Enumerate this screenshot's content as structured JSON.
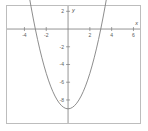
{
  "figure": {
    "name": "parabola-graph",
    "background_color": "#ffffff",
    "frame_color": "#bdbdbd",
    "axis_color": "#7a7a7a",
    "curve_color": "#808080",
    "label_color": "#5a5a5a"
  },
  "chart_data": {
    "type": "line",
    "title": "",
    "xlabel": "x",
    "ylabel": "y",
    "xlim": [
      -5.6,
      6.6
    ],
    "ylim": [
      -10.6,
      2.6
    ],
    "grid": false,
    "legend": null,
    "x_ticks": [
      -4,
      -2,
      2,
      4,
      6
    ],
    "x_tick_labels": [
      "-4",
      "-2",
      "2",
      "4",
      "6"
    ],
    "y_ticks": [
      2,
      -2,
      -4,
      -6,
      -8
    ],
    "y_tick_labels": [
      "2",
      "-2",
      "-4",
      "-6",
      "-8"
    ],
    "equation": "y = x^2 - 9",
    "vertex": [
      0,
      -9
    ],
    "x_intercepts": [
      -3,
      3
    ],
    "y_intercept": -9,
    "series": [
      {
        "name": "y = x^2 - 9",
        "x": [
          -3.6,
          -3.4,
          -3.2,
          -3.0,
          -2.8,
          -2.6,
          -2.4,
          -2.2,
          -2.0,
          -1.8,
          -1.6,
          -1.4,
          -1.2,
          -1.0,
          -0.8,
          -0.6,
          -0.4,
          -0.2,
          0.0,
          0.2,
          0.4,
          0.6,
          0.8,
          1.0,
          1.2,
          1.4,
          1.6,
          1.8,
          2.0,
          2.2,
          2.4,
          2.6,
          2.8,
          3.0,
          3.2,
          3.4,
          3.6
        ],
        "y": [
          3.96,
          2.56,
          1.24,
          0.0,
          -1.16,
          -2.24,
          -3.24,
          -4.16,
          -5.0,
          -5.76,
          -6.44,
          -7.04,
          -7.56,
          -8.0,
          -8.36,
          -8.64,
          -8.84,
          -8.96,
          -9.0,
          -8.96,
          -8.84,
          -8.64,
          -8.36,
          -8.0,
          -7.56,
          -7.04,
          -6.44,
          -5.76,
          -5.0,
          -4.16,
          -3.24,
          -2.24,
          -1.16,
          0.0,
          1.24,
          2.56,
          3.96
        ]
      }
    ]
  }
}
